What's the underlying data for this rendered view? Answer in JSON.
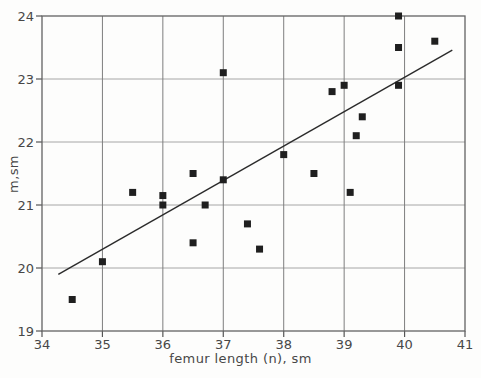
{
  "chart_data": {
    "type": "scatter",
    "title": "",
    "xlabel": "femur length (n), sm",
    "ylabel": "m,sm",
    "xlim": [
      34,
      41
    ],
    "ylim": [
      19,
      24
    ],
    "xticks": [
      34,
      35,
      36,
      37,
      38,
      39,
      40,
      41
    ],
    "yticks": [
      19,
      20,
      21,
      22,
      23,
      24
    ],
    "grid": true,
    "legend": "none",
    "marker": "filled-square",
    "points": [
      [
        34.5,
        19.5
      ],
      [
        35.0,
        20.1
      ],
      [
        35.5,
        21.2
      ],
      [
        36.0,
        21.15
      ],
      [
        36.0,
        21.0
      ],
      [
        36.5,
        21.5
      ],
      [
        36.5,
        20.4
      ],
      [
        36.7,
        21.0
      ],
      [
        37.0,
        23.1
      ],
      [
        37.0,
        21.4
      ],
      [
        37.4,
        20.7
      ],
      [
        37.6,
        20.3
      ],
      [
        38.0,
        21.8
      ],
      [
        38.5,
        21.5
      ],
      [
        38.8,
        22.8
      ],
      [
        39.0,
        22.9
      ],
      [
        39.1,
        21.2
      ],
      [
        39.2,
        22.1
      ],
      [
        39.3,
        22.4
      ],
      [
        39.9,
        24.0
      ],
      [
        39.9,
        23.5
      ],
      [
        39.9,
        22.9
      ],
      [
        40.5,
        23.6
      ]
    ],
    "trend_line": {
      "x1": 34.27,
      "y1": 19.9,
      "x2": 40.79,
      "y2": 23.46
    }
  },
  "colors": {
    "background": "#fdfdfc",
    "marker": "#1f1f1f",
    "trend_line": "#2b2b2b",
    "grid_vertical": "#7e7e7e",
    "grid_horizontal": "#a6a6a6",
    "frame": "#636363",
    "tick": "#555555",
    "tick_text": "#474747"
  }
}
